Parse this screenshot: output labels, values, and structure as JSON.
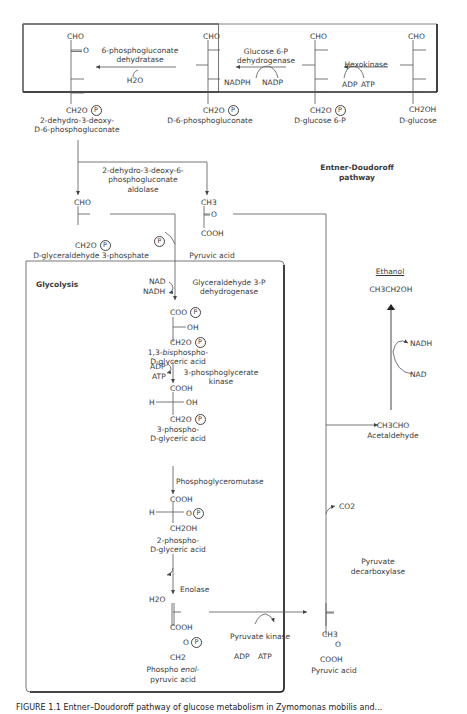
{
  "entner_doudoroff": {
    "title_line1": "Entner-Doudoroff",
    "title_line2": "pathway",
    "compounds": {
      "kdpg_line1": "2-dehydro-3-deoxy-",
      "kdpg_line2": "D-6-phosphogluconate",
      "phosphogluconate": "D-6-phosphogluconate",
      "glucose6p": "D-glucose 6-P",
      "glucose": "D-glucose"
    },
    "enzymes": {
      "dehydratase_line1": "6-phosphogluconate",
      "dehydratase_line2": "dehydratase",
      "g6pdh_line1": "Glucose 6-P",
      "g6pdh_line2": "dehydrogenase",
      "hexokinase": "Hexokinase",
      "aldolase_line1": "2-dehydro-3-deoxy-6-",
      "aldolase_line2": "phosphogluconate",
      "aldolase_line3": "aldolase"
    },
    "cofactors": {
      "h2o": "H2O",
      "nadph": "NADPH",
      "nadp": "NADP",
      "adp": "ADP",
      "atp": "ATP"
    }
  },
  "split_products": {
    "g3p": "D-glyceraldehyde 3-phosphate",
    "pyruvic_acid": "Pyruvic acid"
  },
  "glycolysis": {
    "title": "Glycolysis",
    "enzymes": {
      "gapdh_line1": "Glyceraldehyde 3-P",
      "gapdh_line2": "dehydrogenase",
      "pgk_line1": "3-phosphoglycerate",
      "pgk_line2": "kinase",
      "pgm": "Phosphoglyceromutase",
      "enolase": "Enolase",
      "pk": "Pyruvate kinase"
    },
    "compounds": {
      "bpg_line1_a": "1,3-",
      "bpg_line1_b": "bis",
      "bpg_line1_c": "phospho-",
      "bpg_line2": "D-glyceric acid",
      "pg3_line1": "3-phospho-",
      "pg3_line2": "D-glyceric acid",
      "pg2_line1": "2-phospho-",
      "pg2_line2": "D-glyceric acid",
      "pep_line1_a": "Phospho ",
      "pep_line1_b": "enol-",
      "pep_line2": "pyruvic acid",
      "pyruvic_acid": "Pyruvic acid"
    },
    "cofactors": {
      "nad": "NAD",
      "nadh": "NADH",
      "adp": "ADP",
      "atp": "ATP",
      "h2o": "H2O",
      "pk_adp": "ADP",
      "pk_atp": "ATP"
    }
  },
  "fermentation": {
    "ethanol_label": "Ethanol",
    "ethanol_formula": "CH3CH2OH",
    "nadh": "NADH",
    "nad": "NAD",
    "acetaldehyde_formula": "CH3CHO",
    "acetaldehyde_label": "Acetaldehyde",
    "co2": "CO2",
    "decarboxylase_line1": "Pyruvate",
    "decarboxylase_line2": "decarboxylase"
  },
  "groups": {
    "cho": "CHO",
    "ch2o": "CH2O",
    "ch2oh": "CH2OH",
    "ch3": "CH3",
    "cooh": "COOH",
    "coo": "COO",
    "oh": "OH",
    "h": "H",
    "o": "O",
    "ch2": "CH2",
    "p": "P"
  },
  "caption": "FIGURE 1.1   Entner–Doudoroff pathway of glucose metabolism in Zymomonas mobilis and..."
}
